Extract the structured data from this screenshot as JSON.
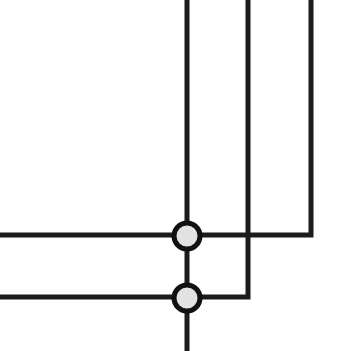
{
  "diagram": {
    "type": "wire-junction-schematic",
    "canvas": {
      "width": 357,
      "height": 351,
      "background": "#ffffff"
    },
    "colors": {
      "wire": "#1c1c1c",
      "junction_fill": "#e2e2e2",
      "junction_stroke": "#111111"
    },
    "wire_width": 5,
    "wires": [
      {
        "id": "vertical-left",
        "points": "187,0 187,351"
      },
      {
        "id": "vertical-middle-to-bottom-row",
        "points": "248,0 248,297 0,297"
      },
      {
        "id": "vertical-right-to-top-row",
        "points": "311,0 311,235 0,235"
      }
    ],
    "junctions": [
      {
        "id": "junction-top",
        "cx": 187,
        "cy": 236,
        "r": 13
      },
      {
        "id": "junction-bottom",
        "cx": 187,
        "cy": 298,
        "r": 13
      }
    ],
    "crossings": [
      {
        "id": "crossing-no-connect",
        "x": 248,
        "y": 235
      }
    ]
  }
}
